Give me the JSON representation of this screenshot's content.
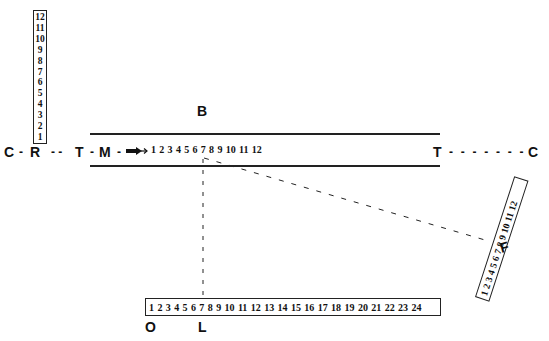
{
  "diagram": {
    "labels": {
      "B": "B",
      "C_left": "C",
      "R": "R",
      "T_left": "T",
      "M": "M",
      "T_right": "T",
      "C_right": "C",
      "F": "F",
      "O": "O",
      "L": "L"
    },
    "dashes": {
      "c_r": "-",
      "r_t": "- -",
      "t_m": "-",
      "m_arrow": "-",
      "t_c": "- - - - - - -"
    },
    "arrow_icon": "bold-right-arrow",
    "vertical_scale_R": [
      "12",
      "11",
      "10",
      "9",
      "8",
      "7",
      "6",
      "5",
      "4",
      "3",
      "2",
      "1"
    ],
    "horizontal_scale_M": [
      "1",
      "2",
      "3",
      "4",
      "5",
      "6",
      "7",
      "8",
      "9",
      "10",
      "11",
      "12"
    ],
    "rotated_scale_F": [
      "1",
      "2",
      "3",
      "4",
      "5",
      "6",
      "7",
      "8",
      "9",
      "10",
      "11",
      "12"
    ],
    "bottom_scale_OL": [
      "1",
      "2",
      "3",
      "4",
      "5",
      "6",
      "7",
      "8",
      "9",
      "10",
      "11",
      "12",
      "13",
      "14",
      "15",
      "16",
      "17",
      "18",
      "19",
      "20",
      "21",
      "22",
      "23",
      "24"
    ],
    "connectors": [
      {
        "from": "M scale 7",
        "to": "bottom scale 7 (L)",
        "style": "dashed-vertical"
      },
      {
        "from": "M scale 7",
        "to": "F scale 7",
        "style": "dashed-diagonal"
      }
    ],
    "colors": {
      "ink": "#111111",
      "background": "#ffffff"
    }
  }
}
